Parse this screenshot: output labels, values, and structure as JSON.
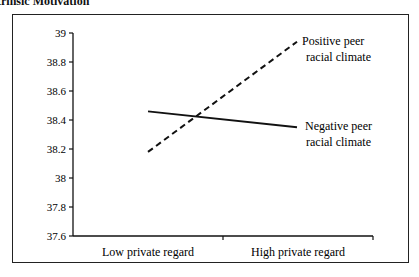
{
  "figure": {
    "title": "trinsic Motivation"
  },
  "chart_data": {
    "type": "line",
    "title": "trinsic Motivation",
    "xlabel": "",
    "ylabel": "",
    "categories": [
      "Low private regard",
      "High private regard"
    ],
    "series": [
      {
        "name": "Positive peer racial climate",
        "style": "dashed",
        "values": [
          38.18,
          38.94
        ]
      },
      {
        "name": "Negative peer racial climate",
        "style": "solid",
        "values": [
          38.46,
          38.35
        ]
      }
    ],
    "ylim": [
      37.6,
      39
    ],
    "yticks": [
      "39",
      "38.8",
      "38.6",
      "38.4",
      "38.2",
      "38",
      "37.8",
      "37.6"
    ],
    "grid": false,
    "legend_position": "inline-right",
    "annotations": [
      {
        "text_line1": "Positive peer",
        "text_line2": "racial climate"
      },
      {
        "text_line1": "Negative peer",
        "text_line2": "racial climate"
      }
    ],
    "colors": {
      "line": "#111111",
      "frame": "#222222"
    }
  }
}
